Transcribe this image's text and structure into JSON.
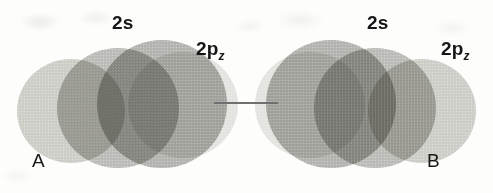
{
  "figure": {
    "background_color": "#fdfdfc",
    "line_color": "#6f6f6f",
    "text_color": "#161616",
    "orbital_fill_outer": "#cfcfcb",
    "orbital_fill_mid": "#bcbcb8",
    "orbital_fill_core": "#b4b4b0"
  },
  "atoms": [
    {
      "id": "A",
      "atom_label": "A",
      "orbital_s_label": "2s",
      "orbital_p_label": "2p",
      "orbital_p_subscript": "z"
    },
    {
      "id": "B",
      "atom_label": "B",
      "orbital_s_label": "2s",
      "orbital_p_label": "2p",
      "orbital_p_subscript": "z"
    }
  ],
  "bond": {
    "label": "",
    "description": "internuclear leader line"
  }
}
